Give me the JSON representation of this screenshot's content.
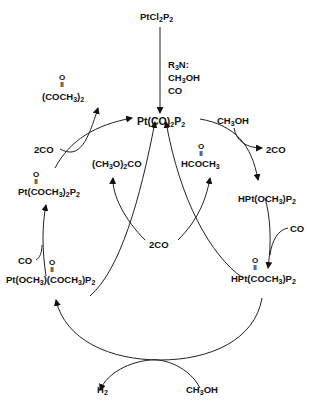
{
  "diagram": {
    "precursor": {
      "text": "PtCl2P2"
    },
    "precursor_conditions": [
      "R3N:",
      "CH3OH",
      "CO"
    ],
    "center": {
      "text": "Pt(CO)2P2"
    },
    "species": [
      {
        "id": "hpt-och3",
        "text": "HPt(OCH3)P2"
      },
      {
        "id": "hpt-coch3",
        "text": "HPt(COCH3)P2",
        "oxo_note": "O ="
      },
      {
        "id": "pt-och3-coch3",
        "text": "Pt(OCH3)(COCH3)P2",
        "oxo_note": "O ="
      },
      {
        "id": "pt-coch3-2",
        "text": "Pt(COCH3)2P2",
        "oxo_note": "O ="
      }
    ],
    "reagents": {
      "ch3oh_top": "CH3OH",
      "two_co_right": "2CO",
      "co_right": "CO",
      "two_co_center": "2CO",
      "co_left": "CO",
      "two_co_left": "2CO",
      "ch3oh_bottom": "CH3OH"
    },
    "products": {
      "dimethyl_oxalate": "(COCH3)2",
      "dimethyl_carbonate": "(CH3O)2CO",
      "methyl_formate": "HCOCH3",
      "hydrogen": "H2"
    },
    "colors": {
      "ink": "#111111",
      "background": "#ffffff"
    }
  }
}
